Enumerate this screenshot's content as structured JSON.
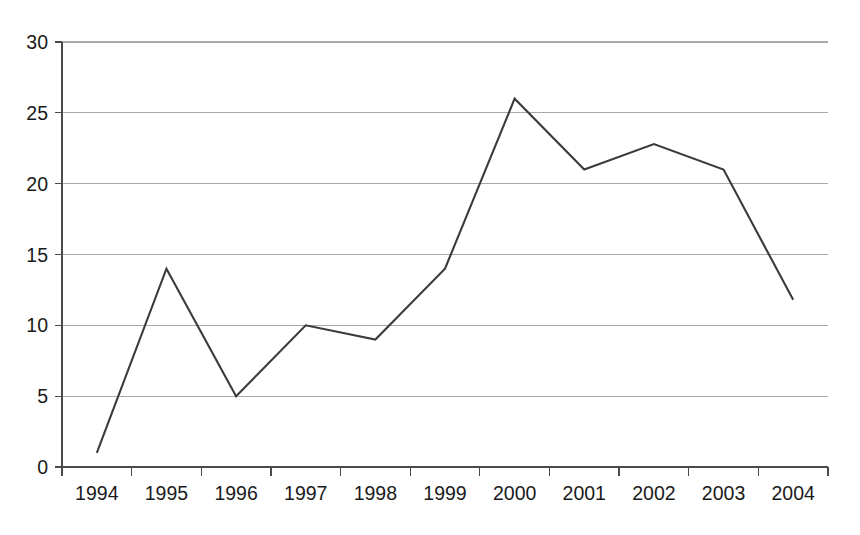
{
  "figure": {
    "caption_sliver": "",
    "background_color": "#ffffff",
    "line_color": "#3b3b3b",
    "grid_color": "#a9a9a9",
    "axis_color": "#4a4a4a",
    "label_color": "#1a1a1a"
  },
  "chart_data": {
    "type": "line",
    "title": "",
    "xlabel": "",
    "ylabel": "",
    "categories": [
      "1994",
      "1995",
      "1996",
      "1997",
      "1998",
      "1999",
      "2000",
      "2001",
      "2002",
      "2003",
      "2004"
    ],
    "values": [
      1,
      14,
      5,
      10,
      9,
      14,
      26,
      21,
      22.8,
      21,
      11.8
    ],
    "series": [
      {
        "name": "series-1",
        "values": [
          1,
          14,
          5,
          10,
          9,
          14,
          26,
          21,
          22.8,
          21,
          11.8
        ]
      }
    ],
    "ylim": [
      0,
      30
    ],
    "ytick_values": [
      0,
      5,
      10,
      15,
      20,
      25,
      30
    ],
    "ytick_labels": [
      "0",
      "5",
      "10",
      "15",
      "20",
      "25",
      "30"
    ],
    "xtick_labels": [
      "1994",
      "1995",
      "1996",
      "1997",
      "1998",
      "1999",
      "2000",
      "2001",
      "2002",
      "2003",
      "2004"
    ],
    "grid": true,
    "grid_axis": "y",
    "legend": false,
    "legend_position": "none",
    "markers": false,
    "annotations": []
  },
  "axes": {
    "y_axis_name": "value-axis",
    "x_axis_name": "year-axis"
  }
}
